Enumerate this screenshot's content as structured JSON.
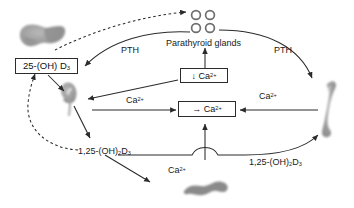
{
  "figure": {
    "background_color": "#ffffff",
    "line_color": "#2b2b2b",
    "organ_color": "#9a9a9a"
  },
  "nodes": {
    "vitd_liver_box": {
      "label_prefix": "25-(OH) D",
      "label_sub": "3"
    },
    "low_calcium_box": {
      "arrow": "↓",
      "label": " Ca",
      "sup": "2+"
    },
    "calcium_box": {
      "arrow": "→",
      "label": " Ca",
      "sup": "2+"
    },
    "parathyroid_label": "Parathyroid glands",
    "vitd_kidney_left": {
      "prefix": "1,25-(OH)",
      "sub1": "2",
      "mid": "D",
      "sub2": "3"
    },
    "vitd_kidney_right": {
      "prefix": "1,25-(OH)",
      "sub1": "2",
      "mid": "D",
      "sub2": "3"
    }
  },
  "edge_labels": {
    "pth_left": "PTH",
    "pth_right": "PTH",
    "calcium_left": {
      "text": "Ca",
      "sup": "2+"
    },
    "calcium_right": {
      "text": "Ca",
      "sup": "2+"
    },
    "calcium_gut": {
      "text": "Ca",
      "sup": "2+"
    }
  },
  "organs": {
    "liver": "liver",
    "kidney": "kidney",
    "bone": "bone",
    "intestine": "intestine",
    "parathyroid_glands": "parathyroid-glands"
  }
}
